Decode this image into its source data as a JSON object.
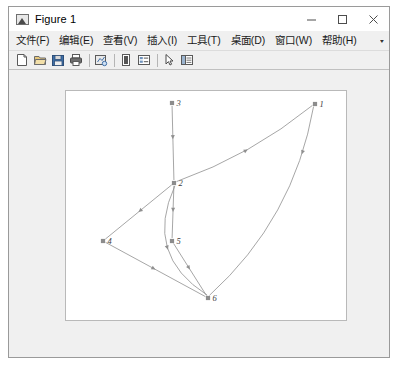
{
  "window": {
    "title": "Figure 1",
    "icon": "matlab-figure-icon",
    "controls": [
      {
        "name": "minimize-button",
        "glyph": "–"
      },
      {
        "name": "maximize-button",
        "glyph": "□"
      },
      {
        "name": "close-button",
        "glyph": "✕"
      }
    ]
  },
  "menu": {
    "items": [
      {
        "name": "menu-file",
        "label": "文件(F)"
      },
      {
        "name": "menu-edit",
        "label": "编辑(E)"
      },
      {
        "name": "menu-view",
        "label": "查看(V)"
      },
      {
        "name": "menu-insert",
        "label": "插入(I)"
      },
      {
        "name": "menu-tools",
        "label": "工具(T)"
      },
      {
        "name": "menu-desktop",
        "label": "桌面(D)"
      },
      {
        "name": "menu-window",
        "label": "窗口(W)"
      },
      {
        "name": "menu-help",
        "label": "帮助(H)"
      }
    ],
    "overflow_glyph": "▾"
  },
  "toolbar": {
    "buttons": [
      {
        "name": "new-figure-icon",
        "kind": "page"
      },
      {
        "name": "open-file-icon",
        "kind": "folder"
      },
      {
        "name": "save-figure-icon",
        "kind": "floppy"
      },
      {
        "name": "print-figure-icon",
        "kind": "printer"
      },
      {
        "name": "separator",
        "kind": "sep"
      },
      {
        "name": "link-plot-icon",
        "kind": "link"
      },
      {
        "name": "separator",
        "kind": "sep"
      },
      {
        "name": "insert-colorbar-icon",
        "kind": "colorbar"
      },
      {
        "name": "insert-legend-icon",
        "kind": "legend"
      },
      {
        "name": "separator",
        "kind": "sep"
      },
      {
        "name": "edit-plot-arrow-icon",
        "kind": "arrow"
      },
      {
        "name": "show-plot-tools-icon",
        "kind": "plottools"
      }
    ]
  },
  "chart_data": {
    "type": "diagram-graph",
    "title": "",
    "directed": true,
    "node_color": "#8c8c8c",
    "edge_color": "#8f8f8f",
    "background": "#ffffff",
    "nodes": [
      {
        "id": "1",
        "label": "1",
        "x": 249,
        "y": 13
      },
      {
        "id": "2",
        "label": "2",
        "x": 108,
        "y": 92
      },
      {
        "id": "3",
        "label": "3",
        "x": 106,
        "y": 12
      },
      {
        "id": "4",
        "label": "4",
        "x": 37,
        "y": 150
      },
      {
        "id": "5",
        "label": "5",
        "x": 106,
        "y": 150
      },
      {
        "id": "6",
        "label": "6",
        "x": 142,
        "y": 207
      }
    ],
    "edges": [
      {
        "from": "3",
        "to": "2",
        "curve": 0,
        "arrow_t": 0.45
      },
      {
        "from": "1",
        "to": "2",
        "curve": -14,
        "arrow_t": 0.5,
        "reverse_arrow": true
      },
      {
        "from": "2",
        "to": "4",
        "curve": 0,
        "arrow_t": 0.5
      },
      {
        "from": "2",
        "to": "5",
        "curve": 0,
        "arrow_t": 0.5
      },
      {
        "from": "2",
        "to": "6",
        "curve": 52,
        "arrow_t": 0.52
      },
      {
        "from": "4",
        "to": "6",
        "curve": 0,
        "arrow_t": 0.5
      },
      {
        "from": "5",
        "to": "6",
        "curve": 0,
        "arrow_t": 0.5
      },
      {
        "from": "1",
        "to": "6",
        "curve": -38,
        "arrow_t": 0.22
      }
    ]
  }
}
